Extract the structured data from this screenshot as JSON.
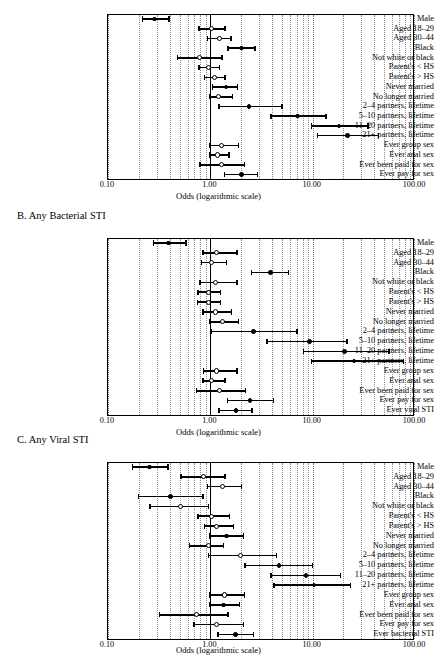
{
  "figure": {
    "axis_title": "Odds (logarithmic scale)",
    "tick_labels": [
      "0.10",
      "1.00",
      "10.00",
      "100.00"
    ],
    "tick_values": [
      0.1,
      1,
      10,
      100
    ],
    "axis_min": 0.1,
    "axis_max": 100,
    "reference_value": 1.0,
    "marker_legend": {
      "filled": "statistically significant",
      "open": "not statistically significant"
    }
  },
  "chart_data": {
    "type": "scatter",
    "title": "",
    "xlabel": "Odds (logarithmic scale)",
    "ylabel": "",
    "xlim": [
      0.1,
      100
    ],
    "xscale": "log",
    "grid": true,
    "legend_position": "none",
    "panels": [
      {
        "id": "A",
        "title": "",
        "rows": [
          {
            "label": "Male",
            "odds": 0.29,
            "low": 0.22,
            "high": 0.41,
            "marker": "filled"
          },
          {
            "label": "Aged 18–29",
            "odds": 1.05,
            "low": 0.78,
            "high": 1.45,
            "marker": "open"
          },
          {
            "label": "Aged 30–44",
            "odds": 1.25,
            "low": 0.95,
            "high": 1.65,
            "marker": "open"
          },
          {
            "label": "Black",
            "odds": 2.05,
            "low": 1.5,
            "high": 2.85,
            "marker": "filled"
          },
          {
            "label": "Not white or black",
            "odds": 0.8,
            "low": 0.48,
            "high": 1.35,
            "marker": "open"
          },
          {
            "label": "Parent's < HS",
            "odds": 0.98,
            "low": 0.78,
            "high": 1.28,
            "marker": "open"
          },
          {
            "label": "Parent's > HS",
            "odds": 1.12,
            "low": 0.88,
            "high": 1.45,
            "marker": "open"
          },
          {
            "label": "Never married",
            "odds": 1.45,
            "low": 1.05,
            "high": 1.92,
            "marker": "filled"
          },
          {
            "label": "No longer married",
            "odds": 1.24,
            "low": 1.0,
            "high": 1.72,
            "marker": "open"
          },
          {
            "label": "2–4 partners, lifetime",
            "odds": 2.45,
            "low": 1.22,
            "high": 5.2,
            "marker": "filled"
          },
          {
            "label": "5–10 partners, lifetime",
            "odds": 7.3,
            "low": 3.95,
            "high": 14.0,
            "marker": "filled"
          },
          {
            "label": "11–20 partners, lifetime",
            "odds": 18.5,
            "low": 9.8,
            "high": 36.0,
            "marker": "filled"
          },
          {
            "label": "21+ partners, lifetime",
            "odds": 22.5,
            "low": 11.2,
            "high": 46.0,
            "marker": "filled"
          },
          {
            "label": "Ever group sex",
            "odds": 1.32,
            "low": 1.0,
            "high": 1.95,
            "marker": "open"
          },
          {
            "label": "Ever anal sex",
            "odds": 1.2,
            "low": 1.0,
            "high": 1.58,
            "marker": "open"
          },
          {
            "label": "Ever been paid for sex",
            "odds": 1.32,
            "low": 0.8,
            "high": 2.25,
            "marker": "open"
          },
          {
            "label": "Ever pay for sex",
            "odds": 2.05,
            "low": 1.38,
            "high": 3.0,
            "marker": "filled"
          }
        ]
      },
      {
        "id": "B",
        "title": "B. Any Bacterial STI",
        "rows": [
          {
            "label": "Male",
            "odds": 0.4,
            "low": 0.28,
            "high": 0.6,
            "marker": "filled"
          },
          {
            "label": "Aged 18–29",
            "odds": 1.18,
            "low": 0.85,
            "high": 1.9,
            "marker": "open"
          },
          {
            "label": "Aged 30–44",
            "odds": 1.05,
            "low": 0.82,
            "high": 1.5,
            "marker": "open"
          },
          {
            "label": "Black",
            "odds": 3.95,
            "low": 2.55,
            "high": 6.0,
            "marker": "filled"
          },
          {
            "label": "Not white or black",
            "odds": 1.15,
            "low": 0.8,
            "high": 1.9,
            "marker": "open"
          },
          {
            "label": "Parent's < HS",
            "odds": 0.98,
            "low": 0.76,
            "high": 1.3,
            "marker": "open"
          },
          {
            "label": "Parent's > HS",
            "odds": 0.98,
            "low": 0.75,
            "high": 1.3,
            "marker": "open"
          },
          {
            "label": "Never married",
            "odds": 1.14,
            "low": 0.85,
            "high": 1.68,
            "marker": "open"
          },
          {
            "label": "No longer married",
            "odds": 1.35,
            "low": 1.0,
            "high": 1.95,
            "marker": "open"
          },
          {
            "label": "2–4 partners, lifetime",
            "odds": 2.7,
            "low": 1.02,
            "high": 7.3,
            "marker": "filled"
          },
          {
            "label": "5–10 partners, lifetime",
            "odds": 9.5,
            "low": 3.6,
            "high": 22.5,
            "marker": "filled"
          },
          {
            "label": "11–20 partners, lifetime",
            "odds": 21.0,
            "low": 8.2,
            "high": 58.0,
            "marker": "filled"
          },
          {
            "label": "21+ partners, lifetime",
            "odds": 26.0,
            "low": 9.8,
            "high": 80.0,
            "marker": "filled"
          },
          {
            "label": "Ever group sex",
            "odds": 1.18,
            "low": 0.86,
            "high": 1.9,
            "marker": "open"
          },
          {
            "label": "Ever anal sex",
            "odds": 1.05,
            "low": 0.85,
            "high": 1.45,
            "marker": "open"
          },
          {
            "label": "Ever been paid for sex",
            "odds": 1.25,
            "low": 0.74,
            "high": 2.3,
            "marker": "open"
          },
          {
            "label": "Ever pay for sex",
            "odds": 2.5,
            "low": 1.48,
            "high": 4.3,
            "marker": "filled"
          },
          {
            "label": "Ever viral STI",
            "odds": 1.82,
            "low": 1.22,
            "high": 2.65,
            "marker": "filled"
          }
        ]
      },
      {
        "id": "C",
        "title": "C. Any Viral STI",
        "rows": [
          {
            "label": "Male",
            "odds": 0.26,
            "low": 0.175,
            "high": 0.4,
            "marker": "filled"
          },
          {
            "label": "Aged 18–29",
            "odds": 0.88,
            "low": 0.52,
            "high": 1.45,
            "marker": "open"
          },
          {
            "label": "Aged 30–44",
            "odds": 1.35,
            "low": 0.95,
            "high": 2.1,
            "marker": "open"
          },
          {
            "label": "Black",
            "odds": 0.42,
            "low": 0.2,
            "high": 0.88,
            "marker": "filled"
          },
          {
            "label": "Not white or black",
            "odds": 0.52,
            "low": 0.26,
            "high": 1.0,
            "marker": "open"
          },
          {
            "label": "Parent's < HS",
            "odds": 1.05,
            "low": 0.76,
            "high": 1.6,
            "marker": "open"
          },
          {
            "label": "Parent's > HS",
            "odds": 1.18,
            "low": 0.88,
            "high": 1.75,
            "marker": "open"
          },
          {
            "label": "Never married",
            "odds": 1.48,
            "low": 1.0,
            "high": 2.2,
            "marker": "filled"
          },
          {
            "label": "No longer married",
            "odds": 0.98,
            "low": 0.63,
            "high": 1.4,
            "marker": "open"
          },
          {
            "label": "2–4 partners, lifetime",
            "odds": 2.0,
            "low": 0.97,
            "high": 4.6,
            "marker": "open"
          },
          {
            "label": "5–10 partners, lifetime",
            "odds": 4.8,
            "low": 2.2,
            "high": 10.3,
            "marker": "filled"
          },
          {
            "label": "11–20 partners, lifetime",
            "odds": 8.8,
            "low": 3.95,
            "high": 19.5,
            "marker": "filled"
          },
          {
            "label": "21+ partners, lifetime",
            "odds": 10.5,
            "low": 4.2,
            "high": 24.5,
            "marker": "filled"
          },
          {
            "label": "Ever group sex",
            "odds": 1.4,
            "low": 1.0,
            "high": 2.25,
            "marker": "open"
          },
          {
            "label": "Ever anal sex",
            "odds": 1.38,
            "low": 1.0,
            "high": 2.0,
            "marker": "filled"
          },
          {
            "label": "Ever been paid for sex",
            "odds": 0.75,
            "low": 0.32,
            "high": 1.55,
            "marker": "open"
          },
          {
            "label": "Ever pay for sex",
            "odds": 1.18,
            "low": 0.7,
            "high": 2.2,
            "marker": "open"
          },
          {
            "label": "Ever bacterial STI",
            "odds": 1.8,
            "low": 1.2,
            "high": 2.75,
            "marker": "filled"
          }
        ]
      }
    ]
  }
}
